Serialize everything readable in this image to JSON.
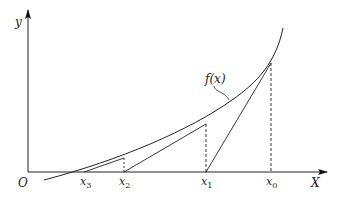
{
  "diagram": {
    "axes": {
      "y_label": "y",
      "x_label": "X",
      "origin_label": "O"
    },
    "curve": {
      "label": "f(x)",
      "label_f": "f",
      "label_paren_open": "(",
      "label_x": "x",
      "label_paren_close": ")"
    },
    "points": [
      {
        "name": "x",
        "sub": "0"
      },
      {
        "name": "x",
        "sub": "1"
      },
      {
        "name": "x",
        "sub": "2"
      },
      {
        "name": "x",
        "sub": "3"
      }
    ],
    "colors": {
      "line": "#222222",
      "background": "#ffffff"
    }
  }
}
